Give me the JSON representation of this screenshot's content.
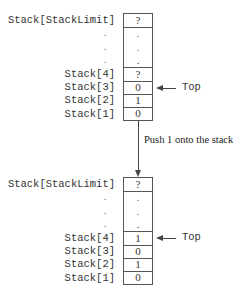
{
  "diagram": {
    "before": {
      "labels": {
        "limit": "Stack[StackLimit]",
        "s4": "Stack[4]",
        "s3": "Stack[3]",
        "s2": "Stack[2]",
        "s1": "Stack[1]",
        "dot": "."
      },
      "values": {
        "limit": "?",
        "s4": "?",
        "s3": "0",
        "s2": "1",
        "s1": "0",
        "dot": "."
      },
      "top_label": "Top",
      "top_index": 3
    },
    "operation": "Push 1 onto the stack",
    "after": {
      "labels": {
        "limit": "Stack[StackLimit]",
        "s4": "Stack[4]",
        "s3": "Stack[3]",
        "s2": "Stack[2]",
        "s1": "Stack[1]",
        "dot": "."
      },
      "values": {
        "limit": "?",
        "s4": "1",
        "s3": "0",
        "s2": "1",
        "s1": "0",
        "dot": "."
      },
      "top_label": "Top",
      "top_index": 4
    }
  }
}
